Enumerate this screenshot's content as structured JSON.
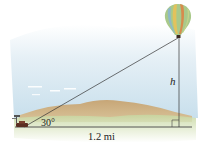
{
  "figure": {
    "labels": {
      "angle": "30°",
      "height": "h",
      "distance": "1.2 mi"
    },
    "colors": {
      "sky": "#cfe3ef",
      "hills": "#c9a779",
      "grass": "#c9d9a8",
      "lines": "#333333",
      "balloon_stripes": [
        "#9ec07a",
        "#e6c35a",
        "#d98a4a",
        "#88b6c9"
      ]
    }
  }
}
